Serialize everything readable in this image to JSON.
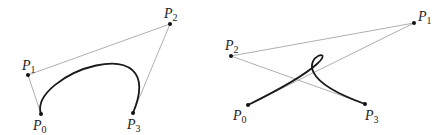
{
  "diagrams": [
    {
      "name": "bezier-simple",
      "points": [
        {
          "label": "P",
          "sub": "0",
          "x": 41,
          "y": 114
        },
        {
          "label": "P",
          "sub": "1",
          "x": 28,
          "y": 75
        },
        {
          "label": "P",
          "sub": "2",
          "x": 170,
          "y": 24
        },
        {
          "label": "P",
          "sub": "3",
          "x": 133,
          "y": 113
        }
      ]
    },
    {
      "name": "bezier-loop",
      "points": [
        {
          "label": "P",
          "sub": "0",
          "x": 248,
          "y": 105
        },
        {
          "label": "P",
          "sub": "1",
          "x": 414,
          "y": 23
        },
        {
          "label": "P",
          "sub": "2",
          "x": 231,
          "y": 56
        },
        {
          "label": "P",
          "sub": "3",
          "x": 365,
          "y": 104
        }
      ]
    }
  ],
  "colors": {
    "curve": "#1a1a1a",
    "control_polygon": "#9a9a9a",
    "point": "#111111"
  }
}
